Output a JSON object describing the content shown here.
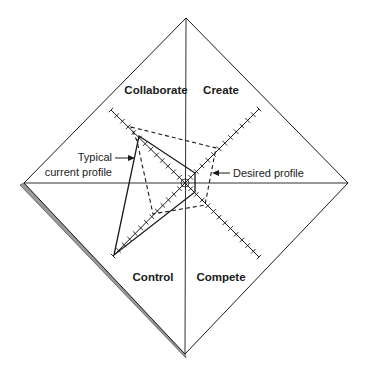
{
  "diagram": {
    "type": "competing-values-radar",
    "colors": {
      "line": "#1a1a1a",
      "shadow": "#9a9a9a",
      "shadow_edge": "#555555",
      "background": "#ffffff"
    },
    "frame": {
      "top": [
        186,
        18
      ],
      "right": [
        348,
        183
      ],
      "bottom": [
        185,
        354
      ],
      "left": [
        24,
        183
      ],
      "center": [
        185,
        183
      ]
    },
    "quadrants": [
      {
        "id": "collaborate",
        "label": "Collaborate",
        "x": 156,
        "y": 94
      },
      {
        "id": "create",
        "label": "Create",
        "x": 221,
        "y": 94
      },
      {
        "id": "control",
        "label": "Control",
        "x": 153,
        "y": 281
      },
      {
        "id": "compete",
        "label": "Compete",
        "x": 221,
        "y": 281
      }
    ],
    "axes": [
      {
        "id": "collaborate-axis",
        "from": [
          185,
          183
        ],
        "to": [
          111,
          110
        ],
        "ticks": 13
      },
      {
        "id": "create-axis",
        "from": [
          185,
          183
        ],
        "to": [
          259,
          109
        ],
        "ticks": 13
      },
      {
        "id": "compete-axis",
        "from": [
          185,
          183
        ],
        "to": [
          259,
          257
        ],
        "ticks": 13
      },
      {
        "id": "control-axis",
        "from": [
          185,
          183
        ],
        "to": [
          113,
          256
        ],
        "ticks": 13
      }
    ],
    "profiles": {
      "typical": {
        "label_line1": "Typical",
        "label_line2": "current profile",
        "style": "solid",
        "points": [
          [
            139,
            136
          ],
          [
            195,
            173
          ],
          [
            195,
            192
          ],
          [
            114,
            255
          ]
        ]
      },
      "desired": {
        "label": "Desired profile",
        "style": "dashed",
        "points": [
          [
            131,
            127
          ],
          [
            216,
            148
          ],
          [
            205,
            205
          ],
          [
            153,
            214
          ],
          [
            137,
            141
          ]
        ]
      }
    },
    "annotations": {
      "typical_label_line1": "Typical",
      "typical_label_line2": "current profile",
      "desired_label": "Desired profile"
    }
  },
  "chart_data": {
    "type": "radar",
    "title": "",
    "categories": [
      "Collaborate",
      "Create",
      "Compete",
      "Control"
    ],
    "scale": {
      "min": 0,
      "max": 13,
      "ticks_per_axis": 13
    },
    "series": [
      {
        "name": "Typical current profile",
        "style": "solid",
        "values": [
          8,
          2,
          2,
          13
        ]
      },
      {
        "name": "Desired profile",
        "style": "dashed",
        "values": [
          9,
          5,
          4,
          6
        ]
      }
    ]
  }
}
